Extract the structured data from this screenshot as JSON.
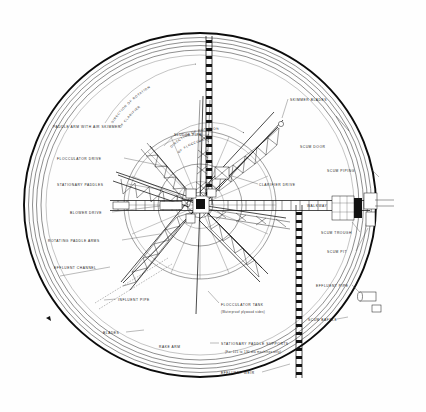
{
  "drawing": {
    "title": "Plan view of circular clarifier with flocculator",
    "type": "engineering-plan-drawing",
    "background_color": "#fefefe",
    "line_color": "#111111"
  },
  "labels": {
    "direction_rotation_clarifier": "DIRECTION OF ROTATION\nOF CLARIFIER",
    "direction_rotation_clarifier_line1": "DIRECTION OF ROTATION",
    "direction_rotation_clarifier_line2": "OF CLARIFIER",
    "direction_rotation_flocculator_line1": "DIRECTION OF ROTATION",
    "direction_rotation_flocculator_line2": "OF FLOCCULATOR",
    "paddle_arm_with_air_skimmer": "PADDLE ARM WITH AIR SKIMMER",
    "flocculator_drive": "FLOCCULATOR DRIVE",
    "stationary_paddles": "STATIONARY PADDLES",
    "blower_drive": "BLOWER DRIVE",
    "rotating_paddle_arms": "ROTATING PADDLE ARMS",
    "effluent_channel": "EFFLUENT CHANNEL",
    "influent_pipe": "INFLUENT PIPE",
    "blades": "BLADES",
    "rake_arm": "RAKE ARM",
    "sludge_pipe": "SLUDGE PIPE",
    "clarifier_drive": "CLARIFIER DRIVE",
    "skimmer_blades": "SKIMMER BLADES",
    "scum_door": "SCUM DOOR",
    "scum_piping": "SCUM PIPING",
    "walkway": "WALKWAY",
    "scum_trough": "SCUM TROUGH",
    "scum_pit": "SCUM PIT",
    "effluent_pipe": "EFFLUENT PIPE",
    "scum_baffle": "SCUM BAFFLE",
    "flocculator_tank": "FLOCCULATOR TANK",
    "flocculator_tank_note": "(Waterproof plywood sides)",
    "stationary_paddle_supports": "STATIONARY PADDLE SUPPORTS",
    "stationary_paddle_supports_note": "(For 115 to 130 dia machines only)",
    "effluent_weir": "EFFLUENT WEIR"
  }
}
